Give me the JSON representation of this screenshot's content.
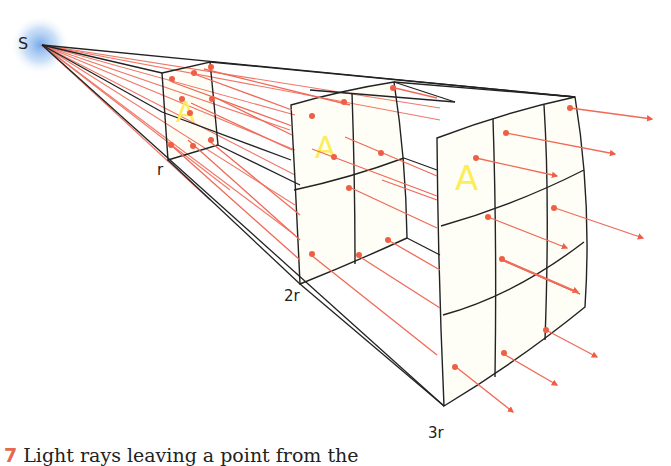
{
  "figure": {
    "source_label": "S",
    "distance_labels": [
      "r",
      "2r",
      "3r"
    ],
    "area_label": "A",
    "caption_number": "7",
    "caption_text": "Light rays leaving a point from the"
  },
  "colors": {
    "ray": "#ef6a57",
    "ray_dot": "#ee5f46",
    "outline": "#222222",
    "area_letter": "#fbee5a",
    "panel_fill": "#fffef6",
    "source_glow": "#7fb0e8"
  }
}
